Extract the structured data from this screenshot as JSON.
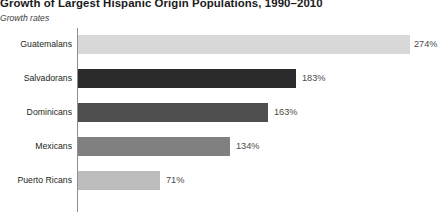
{
  "chart_data": {
    "type": "bar",
    "orientation": "horizontal",
    "title": "Growth of Largest Hispanic Origin Populations, 1990–2010",
    "subtitle": "Growth rates",
    "xlabel": "",
    "ylabel": "",
    "categories": [
      "Guatemalans",
      "Salvadorans",
      "Dominicans",
      "Mexicans",
      "Puerto Ricans"
    ],
    "values": [
      274,
      183,
      163,
      134,
      71
    ],
    "value_labels": [
      "274%",
      "183%",
      "163%",
      "134%",
      "71%"
    ],
    "unit": "%",
    "xlim": [
      0,
      274
    ],
    "grid": false,
    "legend": false,
    "bar_colors": [
      "#d8d8d8",
      "#2b2b2b",
      "#4f4f4f",
      "#808080",
      "#bdbdbd"
    ],
    "axis_color": "#8f8f8f",
    "background": "#ffffff"
  },
  "bars": [
    {
      "category": "Guatemalans",
      "value": 274,
      "label": "274%",
      "color": "#d8d8d8",
      "width_px": 332,
      "label_x_px": 414
    },
    {
      "category": "Salvadorans",
      "value": 183,
      "label": "183%",
      "color": "#2b2b2b",
      "width_px": 218,
      "label_x_px": 302
    },
    {
      "category": "Dominicans",
      "value": 163,
      "label": "163%",
      "color": "#4f4f4f",
      "width_px": 190,
      "label_x_px": 274
    },
    {
      "category": "Mexicans",
      "value": 134,
      "label": "134%",
      "color": "#808080",
      "width_px": 152,
      "label_x_px": 236
    },
    {
      "category": "Puerto Ricans",
      "value": 71,
      "label": "71%",
      "color": "#bdbdbd",
      "width_px": 82,
      "label_x_px": 166
    }
  ]
}
